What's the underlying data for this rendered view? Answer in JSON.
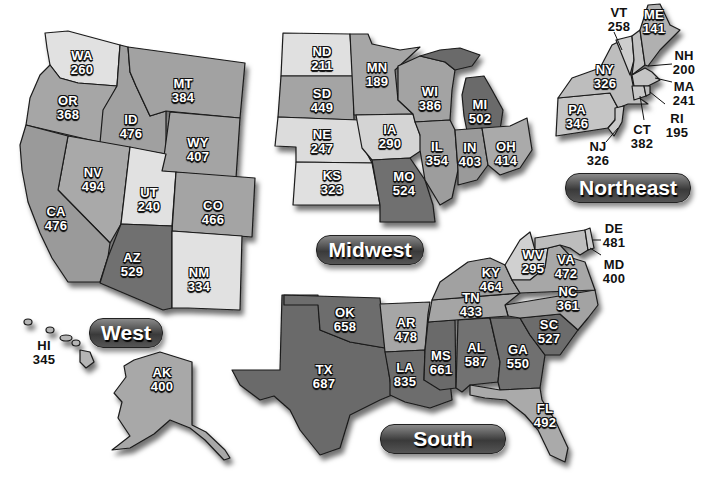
{
  "colors": {
    "lightest": "#e3e3e3",
    "light": "#cfcfcf",
    "mid": "#a9a9a9",
    "midDark": "#8f8f8f",
    "dark": "#747474",
    "darkest": "#5e5e5e"
  },
  "regions": {
    "west": {
      "label": "West",
      "states": {
        "WA": {
          "abbr": "WA",
          "value": "260"
        },
        "OR": {
          "abbr": "OR",
          "value": "368"
        },
        "ID": {
          "abbr": "ID",
          "value": "476"
        },
        "MT": {
          "abbr": "MT",
          "value": "384"
        },
        "WY": {
          "abbr": "WY",
          "value": "407"
        },
        "NV": {
          "abbr": "NV",
          "value": "494"
        },
        "UT": {
          "abbr": "UT",
          "value": "240"
        },
        "CO": {
          "abbr": "CO",
          "value": "466"
        },
        "CA": {
          "abbr": "CA",
          "value": "476"
        },
        "AZ": {
          "abbr": "AZ",
          "value": "529"
        },
        "NM": {
          "abbr": "NM",
          "value": "334"
        },
        "HI": {
          "abbr": "HI",
          "value": "345"
        },
        "AK": {
          "abbr": "AK",
          "value": "400"
        }
      }
    },
    "midwest": {
      "label": "Midwest",
      "states": {
        "ND": {
          "abbr": "ND",
          "value": "211"
        },
        "SD": {
          "abbr": "SD",
          "value": "449"
        },
        "NE": {
          "abbr": "NE",
          "value": "247"
        },
        "KS": {
          "abbr": "KS",
          "value": "323"
        },
        "MN": {
          "abbr": "MN",
          "value": "189"
        },
        "IA": {
          "abbr": "IA",
          "value": "290"
        },
        "MO": {
          "abbr": "MO",
          "value": "524"
        },
        "WI": {
          "abbr": "WI",
          "value": "386"
        },
        "IL": {
          "abbr": "IL",
          "value": "354"
        },
        "MI": {
          "abbr": "MI",
          "value": "502"
        },
        "IN": {
          "abbr": "IN",
          "value": "403"
        },
        "OH": {
          "abbr": "OH",
          "value": "414"
        }
      }
    },
    "northeast": {
      "label": "Northeast",
      "states": {
        "VT": {
          "abbr": "VT",
          "value": "258"
        },
        "ME": {
          "abbr": "ME",
          "value": "141"
        },
        "NH": {
          "abbr": "NH",
          "value": "200"
        },
        "NY": {
          "abbr": "NY",
          "value": "326"
        },
        "MA": {
          "abbr": "MA",
          "value": "241"
        },
        "RI": {
          "abbr": "RI",
          "value": "195"
        },
        "PA": {
          "abbr": "PA",
          "value": "346"
        },
        "CT": {
          "abbr": "CT",
          "value": "382"
        },
        "NJ": {
          "abbr": "NJ",
          "value": "326"
        }
      }
    },
    "south": {
      "label": "South",
      "states": {
        "DE": {
          "abbr": "DE",
          "value": "481"
        },
        "MD": {
          "abbr": "MD",
          "value": "400"
        },
        "WV": {
          "abbr": "WV",
          "value": "295"
        },
        "VA": {
          "abbr": "VA",
          "value": "472"
        },
        "KY": {
          "abbr": "KY",
          "value": "464"
        },
        "NC": {
          "abbr": "NC",
          "value": "361"
        },
        "TN": {
          "abbr": "TN",
          "value": "433"
        },
        "SC": {
          "abbr": "SC",
          "value": "527"
        },
        "OK": {
          "abbr": "OK",
          "value": "658"
        },
        "AR": {
          "abbr": "AR",
          "value": "478"
        },
        "AL": {
          "abbr": "AL",
          "value": "587"
        },
        "GA": {
          "abbr": "GA",
          "value": "550"
        },
        "MS": {
          "abbr": "MS",
          "value": "661"
        },
        "TX": {
          "abbr": "TX",
          "value": "687"
        },
        "LA": {
          "abbr": "LA",
          "value": "835"
        },
        "FL": {
          "abbr": "FL",
          "value": "492"
        }
      }
    }
  }
}
